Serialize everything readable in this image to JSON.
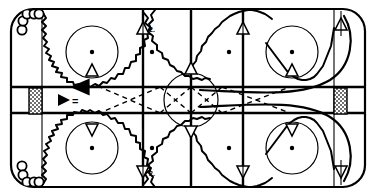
{
  "diagram": {
    "type": "ice-hockey-rink-drill",
    "surface_color": "#ffffff",
    "line_color": "#000000"
  },
  "rink": {
    "label": "ice-surface",
    "goal_left_label": "net",
    "goal_right_label": "net",
    "center_circle_label": "center-faceoff-circle",
    "center_line_label": "center-red-line",
    "blue_line_left_label": "blue-line-left",
    "blue_line_right_label": "blue-line-right",
    "goal_line_left_label": "goal-line-left",
    "goal_line_right_label": "goal-line-right",
    "faceoff_dots": 4,
    "faceoff_circles": 4
  },
  "legend": {
    "arrow_symbol": "◀",
    "equals_symbol": "=",
    "skate_line_label": ""
  },
  "markers": {
    "cone_label": "cone",
    "cone_count": 10,
    "player_label": "player",
    "player_group_top_count": 5,
    "player_group_bottom_count": 5
  },
  "annotations": {
    "mark_top": "2.",
    "mark_bottom": "2."
  },
  "colors": {
    "ink": "#000000",
    "ice": "#ffffff",
    "net_fill": "#9a9a9a"
  }
}
